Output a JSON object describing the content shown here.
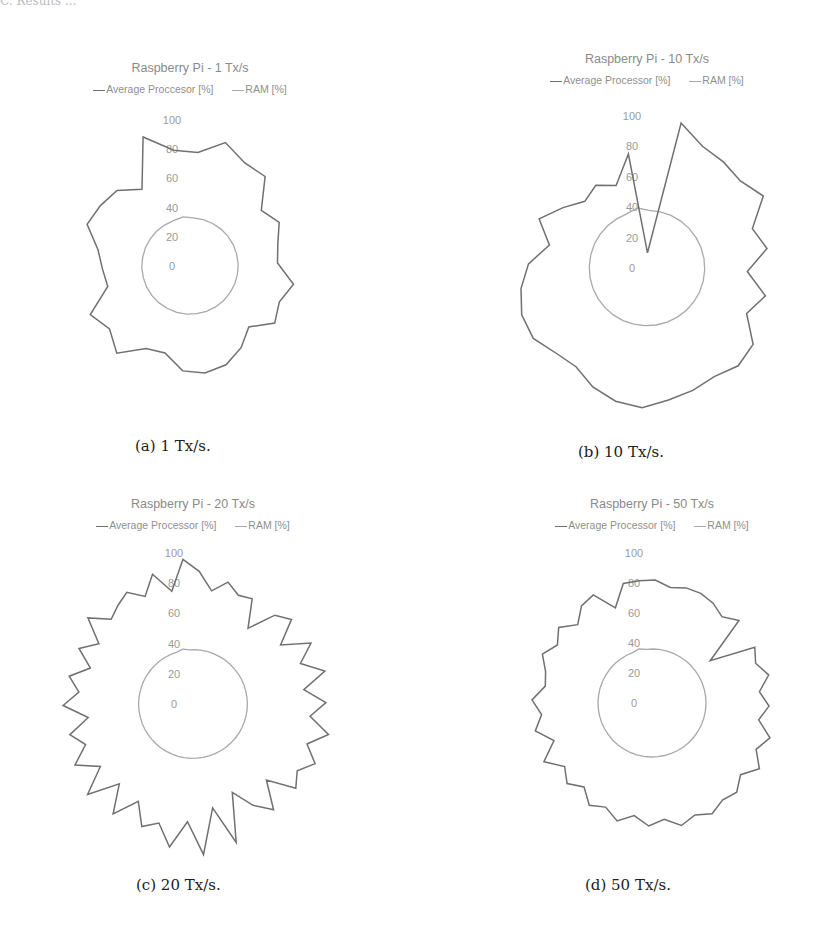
{
  "page": {
    "header_fragment": "C. Results ..."
  },
  "colors": {
    "processor_line": "#707070",
    "ram_line": "#a9a9a9",
    "title_text": "#8a8a8a",
    "tick_text": "#9a9a9a",
    "caption_text": "#222222"
  },
  "chart_data": [
    {
      "id": "a",
      "type": "radar",
      "title": "Raspberry Pi - 1 Tx/s",
      "caption": "(a) 1 Tx/s.",
      "legend": [
        "Average Proccesor [%]",
        "RAM [%]"
      ],
      "radial_ticks": [
        "0",
        "20",
        "40",
        "60",
        "80",
        "100"
      ],
      "rlim": [
        0,
        100
      ],
      "grid": false,
      "series": [
        {
          "name": "Average Proccesor [%]",
          "values": [
            80,
            78,
            88,
            80,
            80,
            62,
            68,
            62,
            60,
            72,
            66,
            70,
            58,
            66,
            72,
            74,
            72,
            62,
            64,
            78,
            70,
            76,
            58,
            60,
            64,
            76,
            74,
            72,
            62,
            94
          ]
        },
        {
          "name": "RAM [%]",
          "values": [
            34,
            33,
            33,
            33,
            33,
            33,
            33,
            33,
            33,
            33,
            33,
            33,
            33,
            33,
            33,
            33,
            33,
            33,
            33,
            33,
            33,
            33,
            33,
            33,
            33,
            33,
            33,
            33,
            33,
            33
          ]
        }
      ]
    },
    {
      "id": "b",
      "type": "radar",
      "title": "Raspberry Pi - 10 Tx/s",
      "caption": "(b) 10 Tx/s.",
      "legend": [
        "Average Processor [%]",
        "RAM [%]"
      ],
      "radial_ticks": [
        "0",
        "20",
        "40",
        "60",
        "80",
        "100"
      ],
      "rlim": [
        0,
        100
      ],
      "grid": false,
      "series": [
        {
          "name": "Average Processor [%]",
          "values": [
            10,
            98,
            88,
            86,
            84,
            90,
            74,
            80,
            66,
            80,
            72,
            86,
            88,
            84,
            86,
            88,
            92,
            90,
            86,
            80,
            82,
            88,
            88,
            84,
            78,
            66,
            78,
            68,
            60,
            64,
            58,
            76
          ]
        },
        {
          "name": "RAM [%]",
          "values": [
            38,
            38,
            38,
            38,
            38,
            38,
            38,
            38,
            38,
            38,
            38,
            38,
            38,
            38,
            38,
            38,
            38,
            38,
            38,
            38,
            38,
            38,
            38,
            38,
            38,
            38,
            38,
            38,
            38,
            38,
            38,
            40
          ]
        }
      ]
    },
    {
      "id": "c",
      "type": "radar",
      "title": "Raspberry Pi - 20 Tx/s",
      "caption": "(c) 20 Tx/s.",
      "legend": [
        "Average Processor [%]",
        "RAM [%]"
      ],
      "radial_ticks": [
        "0",
        "20",
        "40",
        "60",
        "80",
        "100"
      ],
      "rlim": [
        0,
        100
      ],
      "grid": false,
      "series": [
        {
          "name": "Average Processor [%]",
          "values": [
            96,
            88,
            76,
            84,
            78,
            80,
            62,
            80,
            86,
            70,
            88,
            76,
            90,
            74,
            88,
            78,
            92,
            80,
            90,
            82,
            88,
            70,
            88,
            78,
            64,
            96,
            70,
            100,
            78,
            96,
            82,
            88,
            74,
            90,
            72,
            92,
            74,
            88,
            76,
            84,
            70,
            86,
            76,
            84,
            72,
            84,
            74,
            90,
            78,
            82,
            86,
            78,
            90,
            76
          ]
        },
        {
          "name": "RAM [%]",
          "values": [
            36,
            36,
            36,
            36,
            36,
            36,
            36,
            36,
            36,
            36,
            36,
            36,
            36,
            36,
            36,
            36,
            36,
            36,
            36,
            36,
            36,
            36,
            36,
            36,
            36,
            36,
            36,
            36,
            36,
            36,
            36,
            36,
            36,
            36,
            36,
            36,
            36,
            36,
            36,
            36,
            36,
            36,
            36,
            36,
            36,
            36,
            36,
            36,
            36,
            36,
            36,
            36,
            36,
            37
          ]
        }
      ]
    },
    {
      "id": "d",
      "type": "radar",
      "title": "Raspberry Pi - 50 Tx/s",
      "caption": "(d) 50 Tx/s.",
      "legend": [
        "Average Processor [%]",
        "RAM [%]"
      ],
      "radial_ticks": [
        "0",
        "20",
        "40",
        "60",
        "80",
        "100"
      ],
      "rlim": [
        0,
        100
      ],
      "grid": false,
      "series": [
        {
          "name": "Average Processor [%]",
          "values": [
            82,
            82,
            78,
            80,
            80,
            78,
            74,
            80,
            48,
            78,
            74,
            80,
            72,
            78,
            72,
            82,
            76,
            84,
            76,
            82,
            80,
            84,
            80,
            84,
            78,
            82,
            76,
            82,
            76,
            80,
            72,
            78,
            72,
            82,
            70,
            80,
            74,
            80,
            72,
            74,
            80,
            74,
            80,
            72,
            80,
            82,
            68,
            82
          ]
        },
        {
          "name": "RAM [%]",
          "values": [
            36,
            36,
            36,
            36,
            36,
            36,
            36,
            36,
            36,
            36,
            36,
            36,
            36,
            36,
            36,
            36,
            36,
            36,
            36,
            36,
            36,
            36,
            36,
            36,
            36,
            36,
            36,
            36,
            36,
            36,
            36,
            36,
            36,
            36,
            36,
            36,
            36,
            36,
            36,
            36,
            36,
            36,
            36,
            36,
            36,
            36,
            36,
            37
          ]
        }
      ]
    }
  ]
}
